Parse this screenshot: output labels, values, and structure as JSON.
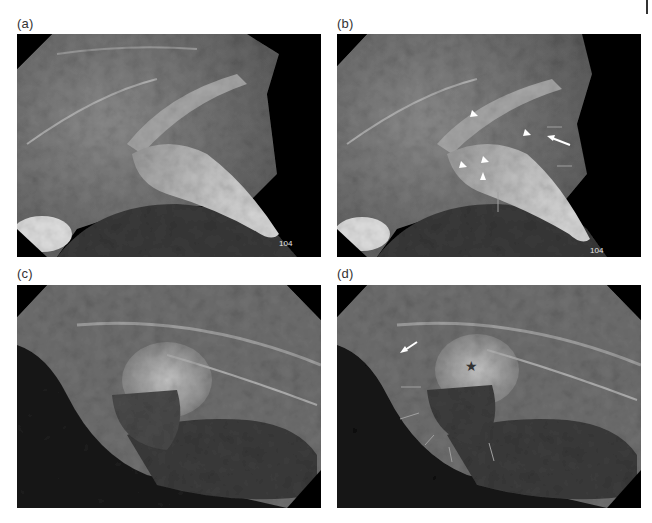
{
  "figure": {
    "panels": [
      {
        "id": "a",
        "label": "(a)",
        "tooth_number": "104",
        "annotations": []
      },
      {
        "id": "b",
        "label": "(b)",
        "tooth_number": "104",
        "annotations": [
          {
            "type": "arrowhead",
            "count": 6,
            "color": "#ffffff"
          },
          {
            "type": "white-arrow",
            "count": 1,
            "color": "#ffffff"
          },
          {
            "type": "thin-arrow",
            "count": 3,
            "color": "#b0b0b0"
          }
        ]
      },
      {
        "id": "c",
        "label": "(c)",
        "annotations": []
      },
      {
        "id": "d",
        "label": "(d)",
        "annotations": [
          {
            "type": "white-arrow",
            "count": 1,
            "color": "#ffffff"
          },
          {
            "type": "star",
            "count": 1,
            "color": "#333333"
          },
          {
            "type": "thin-arrow",
            "count": 5,
            "color": "#a8a8a8"
          }
        ]
      }
    ]
  }
}
